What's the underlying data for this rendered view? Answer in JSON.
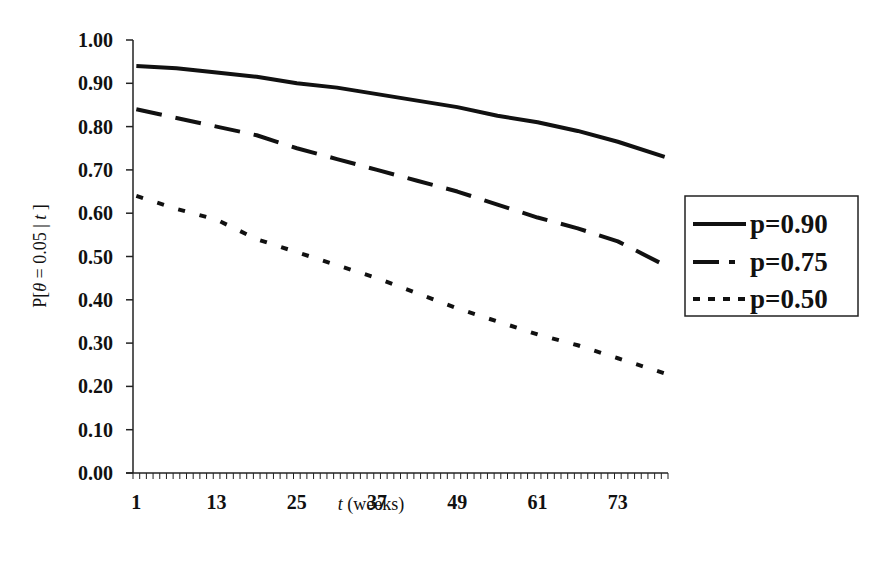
{
  "chart_data": {
    "type": "line",
    "title": "",
    "xlabel": "t (weeks)",
    "xlabel_parts": {
      "italic": "t",
      "rest": " (weeks)"
    },
    "ylabel": "P[θ = 0.05 | t ]",
    "xlim": [
      0.5,
      80.5
    ],
    "ylim": [
      0.0,
      1.0
    ],
    "xticks": [
      1,
      13,
      25,
      37,
      49,
      61,
      73
    ],
    "yticks": [
      "0.00",
      "0.10",
      "0.20",
      "0.30",
      "0.40",
      "0.50",
      "0.60",
      "0.70",
      "0.80",
      "0.90",
      "1.00"
    ],
    "grid": false,
    "legend_position": "right",
    "x": [
      1,
      7,
      13,
      19,
      25,
      31,
      37,
      43,
      49,
      55,
      61,
      67,
      73,
      80
    ],
    "series": [
      {
        "name": "p=0.90",
        "style": "solid",
        "values": [
          0.94,
          0.935,
          0.925,
          0.915,
          0.9,
          0.89,
          0.875,
          0.86,
          0.845,
          0.825,
          0.81,
          0.79,
          0.765,
          0.73
        ]
      },
      {
        "name": "p=0.75",
        "style": "dashed",
        "values": [
          0.84,
          0.82,
          0.8,
          0.78,
          0.75,
          0.725,
          0.7,
          0.675,
          0.65,
          0.62,
          0.59,
          0.565,
          0.535,
          0.48
        ]
      },
      {
        "name": "p=0.50",
        "style": "dotted",
        "values": [
          0.64,
          0.61,
          0.585,
          0.54,
          0.51,
          0.48,
          0.45,
          0.415,
          0.38,
          0.35,
          0.32,
          0.295,
          0.265,
          0.23
        ]
      }
    ]
  },
  "axes": {
    "y_title_prefix": "P[",
    "y_title_theta": "θ",
    "y_title_mid": " = 0.05 | ",
    "y_title_t": "t",
    "y_title_suffix": " ]"
  },
  "legend": {
    "items": [
      {
        "label": "p=0.90",
        "style": "solid"
      },
      {
        "label": "p=0.75",
        "style": "dashed"
      },
      {
        "label": "p=0.50",
        "style": "dotted"
      }
    ]
  }
}
